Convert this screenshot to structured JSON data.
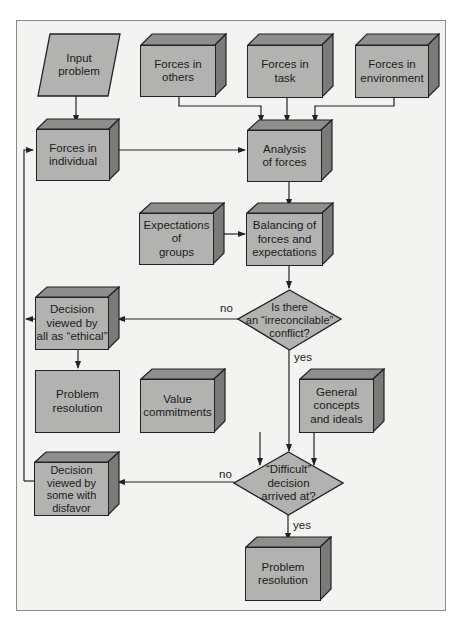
{
  "diagram": {
    "colors": {
      "box_fill": "#b2b2b0",
      "box_top": "#8e8e8c",
      "box_side": "#7a7a78",
      "frame_bg": "#f3f3f1",
      "line": "#222222"
    },
    "nodes": {
      "input_problem": {
        "label": "Input problem",
        "line1": "Input",
        "line2": "problem",
        "shape": "parallelogram"
      },
      "forces_others": {
        "line1": "Forces in",
        "line2": "others",
        "shape": "3d-box"
      },
      "forces_task": {
        "line1": "Forces in",
        "line2": "task",
        "shape": "3d-box"
      },
      "forces_environment": {
        "line1": "Forces in",
        "line2": "environment",
        "shape": "3d-box"
      },
      "forces_individual": {
        "line1": "Forces in",
        "line2": "individual",
        "shape": "3d-box"
      },
      "analysis_forces": {
        "line1": "Analysis",
        "line2": "of forces",
        "shape": "3d-box"
      },
      "expectations_groups": {
        "line1": "Expectations",
        "line2": "of",
        "line3": "groups",
        "shape": "3d-box"
      },
      "balancing": {
        "line1": "Balancing of",
        "line2": "forces and",
        "line3": "expectations",
        "shape": "3d-box"
      },
      "irreconcilable": {
        "line1": "Is there",
        "line2": "an “irreconcilable”",
        "line3": "conflict?",
        "shape": "diamond"
      },
      "decision_ethical": {
        "line1": "Decision",
        "line2": "viewed by",
        "line3": "all as “ethical”",
        "shape": "3d-box"
      },
      "problem_resolution_1": {
        "line1": "Problem",
        "line2": "resolution",
        "shape": "flat-box"
      },
      "value_commitments": {
        "line1": "Value",
        "line2": "commitments",
        "shape": "3d-box"
      },
      "general_concepts": {
        "line1": "General",
        "line2": "concepts",
        "line3": "and ideals",
        "shape": "3d-box"
      },
      "difficult_decision": {
        "line1": "“Difficult”",
        "line2": "decision",
        "line3": "arrived at?",
        "shape": "diamond"
      },
      "decision_disfavor": {
        "line1": "Decision",
        "line2": "viewed by",
        "line3": "some with",
        "line4": "disfavor",
        "shape": "3d-box"
      },
      "problem_resolution_2": {
        "line1": "Problem",
        "line2": "resolution",
        "shape": "3d-box"
      }
    },
    "edge_labels": {
      "irreconcilable_no": "no",
      "irreconcilable_yes": "yes",
      "difficult_no": "no",
      "difficult_yes": "yes"
    },
    "edges": [
      {
        "from": "Input problem",
        "to": "Forces in individual"
      },
      {
        "from": "Forces in others",
        "to": "Analysis of forces"
      },
      {
        "from": "Forces in task",
        "to": "Analysis of forces"
      },
      {
        "from": "Forces in environment",
        "to": "Analysis of forces"
      },
      {
        "from": "Forces in individual",
        "to": "Analysis of forces"
      },
      {
        "from": "Analysis of forces",
        "to": "Balancing of forces and expectations"
      },
      {
        "from": "Expectations of groups",
        "to": "Balancing of forces and expectations"
      },
      {
        "from": "Balancing of forces and expectations",
        "to": "Is there an irreconcilable conflict?"
      },
      {
        "from": "Is there an irreconcilable conflict?",
        "to": "Decision viewed by all as ethical",
        "label": "no"
      },
      {
        "from": "Is there an irreconcilable conflict?",
        "to": "Difficult decision arrived at?",
        "label": "yes"
      },
      {
        "from": "Decision viewed by all as ethical",
        "to": "Problem resolution"
      },
      {
        "from": "Decision viewed by all as ethical",
        "to": "Forces in individual"
      },
      {
        "from": "Value commitments",
        "to": "Difficult decision arrived at?"
      },
      {
        "from": "General concepts and ideals",
        "to": "Difficult decision arrived at?"
      },
      {
        "from": "Difficult decision arrived at?",
        "to": "Decision viewed by some with disfavor",
        "label": "no"
      },
      {
        "from": "Difficult decision arrived at?",
        "to": "Problem resolution",
        "label": "yes"
      },
      {
        "from": "Decision viewed by some with disfavor",
        "to": "Forces in individual"
      }
    ]
  }
}
